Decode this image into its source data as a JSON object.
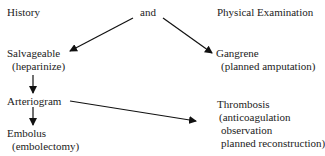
{
  "header": {
    "left": "History",
    "center": "and",
    "right": "Physical Examination"
  },
  "nodes": {
    "salvageable": {
      "title": "Salvageable",
      "detail": "(heparinize)"
    },
    "gangrene": {
      "title": "Gangrene",
      "detail": "(planned amputation)"
    },
    "arteriogram": {
      "title": "Arteriogram"
    },
    "embolus": {
      "title": "Embolus",
      "detail": "(embolectomy)"
    },
    "thrombosis": {
      "title": "Thrombosis",
      "details": [
        "(anticoagulation",
        "observation",
        "planned reconstruction)"
      ]
    }
  },
  "edges": [
    {
      "from": "and",
      "to": "salvageable"
    },
    {
      "from": "and",
      "to": "gangrene"
    },
    {
      "from": "salvageable",
      "to": "arteriogram"
    },
    {
      "from": "arteriogram",
      "to": "embolus"
    },
    {
      "from": "arteriogram",
      "to": "thrombosis"
    }
  ]
}
